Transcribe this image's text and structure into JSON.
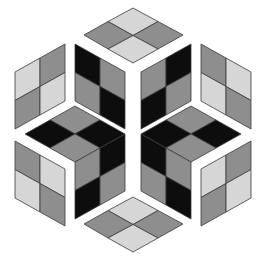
{
  "figure": {
    "title": "",
    "width": 257,
    "height": 260,
    "colors": {
      "background": "#ffffff",
      "black": "#0d0d0d",
      "mid_gray": "#8e8e8e",
      "light_gray": "#d6d6d6",
      "outline": "#3a3a3a"
    },
    "outer_panels": [
      {
        "name": "top-panel",
        "cells": [
          {
            "points": "133,8 158,21.5 133,35.5 108,21.5",
            "fill": "light"
          },
          {
            "points": "158,21.5 183,35 158,49 133,35.5",
            "fill": "mid"
          },
          {
            "points": "108,21.5 133,35.5 108,49 84,35",
            "fill": "mid"
          },
          {
            "points": "133,35.5 158,49 133,63 108,49",
            "fill": "light"
          }
        ]
      },
      {
        "name": "upper-left-panel",
        "cells": [
          {
            "points": "15,72 40,58 40,86.5 15,100.5",
            "fill": "light"
          },
          {
            "points": "40,58 65,44 65,72.5 40,86.5",
            "fill": "mid"
          },
          {
            "points": "15,100.5 40,86.5 40,115 15,129",
            "fill": "mid"
          },
          {
            "points": "40,86.5 65,72.5 65,101 40,115",
            "fill": "light"
          }
        ]
      },
      {
        "name": "upper-right-panel",
        "cells": [
          {
            "points": "201,44 226,58 226,86.5 201,72.5",
            "fill": "mid"
          },
          {
            "points": "226,58 251,72 251,100.5 226,86.5",
            "fill": "light"
          },
          {
            "points": "201,72.5 226,86.5 226,115 201,101",
            "fill": "light"
          },
          {
            "points": "226,86.5 251,100.5 251,129 226,115",
            "fill": "mid"
          }
        ]
      },
      {
        "name": "lower-left-panel",
        "cells": [
          {
            "points": "15,141 40,155 40,183.5 15,169.5",
            "fill": "mid"
          },
          {
            "points": "40,155 65,169 65,197.5 40,183.5",
            "fill": "light"
          },
          {
            "points": "15,169.5 40,183.5 40,212 15,198",
            "fill": "light"
          },
          {
            "points": "40,183.5 65,197.5 65,226 40,212",
            "fill": "mid"
          }
        ]
      },
      {
        "name": "lower-right-panel",
        "cells": [
          {
            "points": "201,169 226,155 226,183.5 201,197.5",
            "fill": "light"
          },
          {
            "points": "226,155 251,141 251,169.5 226,183.5",
            "fill": "mid"
          },
          {
            "points": "201,197.5 226,183.5 226,212 201,226",
            "fill": "mid"
          },
          {
            "points": "226,183.5 251,169.5 251,198 226,212",
            "fill": "light"
          }
        ]
      },
      {
        "name": "bottom-panel",
        "cells": [
          {
            "points": "133,197 158,210.5 133,224.5 108,210.5",
            "fill": "light"
          },
          {
            "points": "158,210.5 183,224 158,238 133,224.5",
            "fill": "mid"
          },
          {
            "points": "108,210.5 133,224.5 108,238 84,224",
            "fill": "mid"
          },
          {
            "points": "133,224.5 158,238 133,252 108,238",
            "fill": "light"
          }
        ]
      }
    ],
    "inner_panels": [
      {
        "name": "inner-upper-left",
        "cells": [
          {
            "points": "75,44 100,58 100,86.5 75,72.5",
            "fill": "black"
          },
          {
            "points": "100,58 125,72 125,100.5 100,86.5",
            "fill": "mid"
          },
          {
            "points": "75,72.5 100,86.5 100,115 75,101",
            "fill": "mid"
          },
          {
            "points": "100,86.5 125,100.5 125,129 100,115",
            "fill": "black"
          }
        ]
      },
      {
        "name": "inner-upper-right",
        "cells": [
          {
            "points": "141,72 166,58 166,86.5 141,100.5",
            "fill": "mid"
          },
          {
            "points": "166,58 191,44 191,72.5 166,86.5",
            "fill": "black"
          },
          {
            "points": "141,100.5 166,86.5 166,115 141,129",
            "fill": "black"
          },
          {
            "points": "166,86.5 191,72.5 191,101 166,115",
            "fill": "mid"
          }
        ]
      },
      {
        "name": "inner-left-top-face",
        "cells": [
          {
            "points": "75,106 100,120 75,134 50,120",
            "fill": "mid"
          },
          {
            "points": "50,120 75,134 50,148 25,134",
            "fill": "black"
          },
          {
            "points": "100,120 125,134 100,148 75,134",
            "fill": "black"
          },
          {
            "points": "75,134 100,148 75,162 50,148",
            "fill": "mid"
          }
        ]
      },
      {
        "name": "inner-left-side",
        "cells": [
          {
            "points": "75,162 100,148 100,176.5 75,190.5",
            "fill": "mid"
          },
          {
            "points": "100,148 125,134 125,162.5 100,176.5",
            "fill": "black"
          },
          {
            "points": "75,190.5 100,176.5 100,205 75,219",
            "fill": "black"
          },
          {
            "points": "100,176.5 125,162.5 125,191 100,205",
            "fill": "mid"
          }
        ]
      },
      {
        "name": "inner-right-top-face",
        "cells": [
          {
            "points": "191,106 216,120 191,134 166,120",
            "fill": "mid"
          },
          {
            "points": "216,120 241,134 216,148 191,134",
            "fill": "black"
          },
          {
            "points": "166,120 191,134 166,148 141,134",
            "fill": "black"
          },
          {
            "points": "191,134 216,148 191,162 166,148",
            "fill": "mid"
          }
        ]
      },
      {
        "name": "inner-right-side",
        "cells": [
          {
            "points": "141,134 166,148 166,176.5 141,162.5",
            "fill": "black"
          },
          {
            "points": "166,148 191,162 191,190.5 166,176.5",
            "fill": "mid"
          },
          {
            "points": "141,162.5 166,176.5 166,205 141,191",
            "fill": "mid"
          },
          {
            "points": "166,176.5 191,190.5 191,219 166,205",
            "fill": "black"
          }
        ]
      }
    ]
  }
}
